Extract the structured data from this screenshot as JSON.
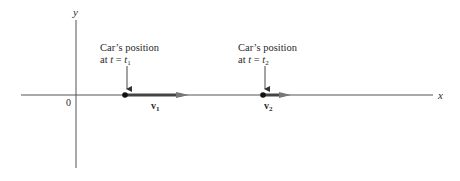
{
  "diagram": {
    "type": "velocity-vectors-on-axes",
    "axes": {
      "x_label": "x",
      "y_label": "y",
      "origin_label": "0"
    },
    "points": [
      {
        "caption_line1": "Car’s position",
        "caption_line2_prefix": "at ",
        "caption_var": "t",
        "caption_eq": " = ",
        "caption_sub_var": "t",
        "caption_sub": "1",
        "vector_label": "v",
        "vector_sub": "1",
        "x": 125,
        "arrow_end_x": 188
      },
      {
        "caption_line1": "Car’s position",
        "caption_line2_prefix": "at ",
        "caption_var": "t",
        "caption_eq": " = ",
        "caption_sub_var": "t",
        "caption_sub": "2",
        "vector_label": "v",
        "vector_sub": "2",
        "x": 263,
        "arrow_end_x": 290
      }
    ],
    "colors": {
      "axis": "#555555",
      "vector": "#444444",
      "arrowhead": "#777777",
      "text": "#2a2a2a"
    }
  }
}
